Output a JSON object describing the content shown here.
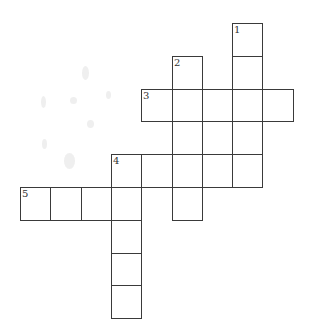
{
  "puzzle": {
    "type": "crossword",
    "origin": {
      "x": 20,
      "y": 23
    },
    "cell_size": {
      "w": 30.3,
      "h": 32.8
    },
    "line_color": "#3a3a3a",
    "background": "#ffffff",
    "cells": [
      {
        "row": 0,
        "col": 7,
        "number": "1"
      },
      {
        "row": 1,
        "col": 5,
        "number": "2"
      },
      {
        "row": 1,
        "col": 7
      },
      {
        "row": 2,
        "col": 4,
        "number": "3"
      },
      {
        "row": 2,
        "col": 5
      },
      {
        "row": 2,
        "col": 6
      },
      {
        "row": 2,
        "col": 7
      },
      {
        "row": 2,
        "col": 8
      },
      {
        "row": 3,
        "col": 5
      },
      {
        "row": 3,
        "col": 6
      },
      {
        "row": 3,
        "col": 7
      },
      {
        "row": 4,
        "col": 3,
        "number": "4"
      },
      {
        "row": 4,
        "col": 4
      },
      {
        "row": 4,
        "col": 5
      },
      {
        "row": 4,
        "col": 6
      },
      {
        "row": 4,
        "col": 7
      },
      {
        "row": 5,
        "col": 0,
        "number": "5"
      },
      {
        "row": 5,
        "col": 1
      },
      {
        "row": 5,
        "col": 2
      },
      {
        "row": 5,
        "col": 3
      },
      {
        "row": 5,
        "col": 5
      },
      {
        "row": 6,
        "col": 3
      },
      {
        "row": 7,
        "col": 3
      },
      {
        "row": 8,
        "col": 3
      }
    ],
    "entries": [
      {
        "number": "1",
        "direction": "down",
        "length": 5
      },
      {
        "number": "2",
        "direction": "down",
        "length": 5
      },
      {
        "number": "3",
        "direction": "across",
        "length": 5
      },
      {
        "number": "4",
        "direction": "across",
        "length": 5
      },
      {
        "number": "4",
        "direction": "down",
        "length": 5
      },
      {
        "number": "5",
        "direction": "across",
        "length": 4
      }
    ]
  }
}
